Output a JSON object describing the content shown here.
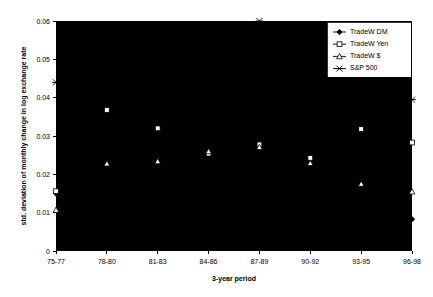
{
  "chart_data": {
    "type": "line",
    "title": "",
    "xlabel": "3-year period",
    "ylabel": "std. deviation of monthly change in log exchange rate",
    "categories": [
      "75-77",
      "78-80",
      "81-83",
      "84-86",
      "87-89",
      "90-92",
      "93-95",
      "96-98"
    ],
    "ylim": [
      0,
      0.06
    ],
    "yticks": [
      "0",
      "0.01",
      "0.02",
      "0.03",
      "0.04",
      "0.05",
      "0.06"
    ],
    "ytick_values": [
      0,
      0.01,
      0.02,
      0.03,
      0.04,
      0.05,
      0.06
    ],
    "grid": false,
    "legend_position": "top-right",
    "series": [
      {
        "name": "TradeW DM",
        "marker": "filled-diamond",
        "values": [
          0.015,
          0.014,
          0.0133,
          0.0125,
          0.0095,
          0.0105,
          0.0108,
          0.0083
        ]
      },
      {
        "name": "TradeW Yen",
        "marker": "open-square",
        "values": [
          0.0156,
          0.0368,
          0.032,
          0.0254,
          0.0278,
          0.0243,
          0.0318,
          0.0283
        ]
      },
      {
        "name": "TradeW $",
        "marker": "open-triangle",
        "values": [
          0.0107,
          0.0228,
          0.0234,
          0.026,
          0.0271,
          0.0229,
          0.0175,
          0.0155
        ]
      },
      {
        "name": "S&P 500",
        "marker": "cross",
        "values": [
          0.044,
          0.0415,
          0.0396,
          0.0392,
          0.06,
          0.0345,
          0.0237,
          0.0395
        ]
      }
    ]
  }
}
